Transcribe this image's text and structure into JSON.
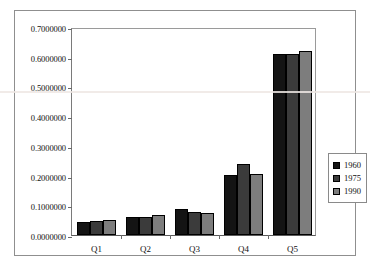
{
  "chart_data": {
    "type": "bar",
    "title": "",
    "subtitle": "",
    "xlabel": "",
    "ylabel": "",
    "categories": [
      "Q1",
      "Q2",
      "Q3",
      "Q4",
      "Q5"
    ],
    "series": [
      {
        "name": "1960",
        "color": "#141414",
        "values": [
          0.045,
          0.06,
          0.087,
          0.202,
          0.61
        ]
      },
      {
        "name": "1975",
        "color": "#3b3b3b",
        "values": [
          0.048,
          0.062,
          0.079,
          0.24,
          0.61
        ]
      },
      {
        "name": "1990",
        "color": "#7d7d7d",
        "values": [
          0.052,
          0.066,
          0.074,
          0.206,
          0.618
        ]
      }
    ],
    "ylim": [
      0.0,
      0.7
    ],
    "ytick_step": 0.1,
    "ytick_labels": [
      "0.7000000",
      "0.6000000",
      "0.5000000",
      "0.4000000",
      "0.3000000",
      "0.2000000",
      "0.1000000",
      "0.0000000"
    ],
    "ytick_values": [
      0.7,
      0.6,
      0.5,
      0.4,
      0.3,
      0.2,
      0.1,
      0.0
    ],
    "grid": false,
    "legend_position": "right",
    "legend_entries": [
      "1960",
      "1975",
      "1990"
    ],
    "annotations": []
  }
}
